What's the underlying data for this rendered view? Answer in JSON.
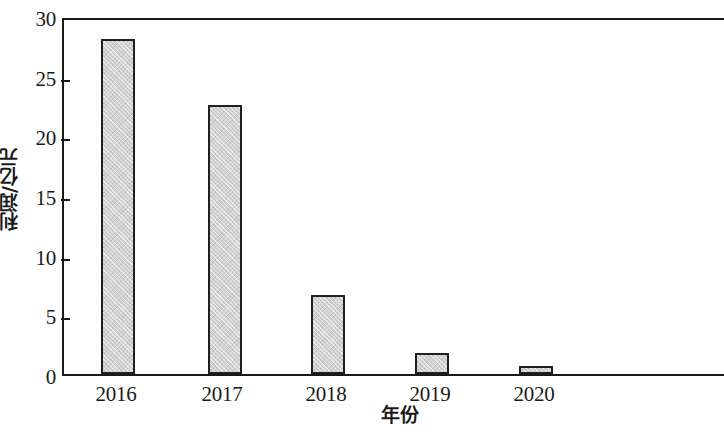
{
  "chart_data": {
    "type": "bar",
    "title": "",
    "subtitle": "",
    "xlabel": "年份",
    "ylabel": "利润/亿元",
    "categories": [
      "2016",
      "2017",
      "2018",
      "2019",
      "2020"
    ],
    "values": [
      28.4,
      22.8,
      6.7,
      1.8,
      0.7
    ],
    "series": [
      {
        "name": "利润/亿元",
        "values": [
          28.4,
          22.8,
          6.7,
          1.8,
          0.7
        ]
      }
    ],
    "ylim": [
      0,
      30
    ],
    "yticks": [
      "0",
      "5",
      "10",
      "15",
      "20",
      "25",
      "30"
    ],
    "ytick_values": [
      0,
      5,
      10,
      15,
      20,
      25,
      30
    ],
    "xticks": [
      "2016",
      "2017",
      "2018",
      "2019",
      "2020"
    ],
    "grid": false,
    "legend": false,
    "legend_position": "none",
    "annotations": [],
    "colors": {
      "bar_fill": "#d2d2d2",
      "bar_border": "#1f1f1f",
      "axis": "#1a1a1a",
      "background": "#ffffff",
      "text": "#1a1a1a"
    }
  }
}
